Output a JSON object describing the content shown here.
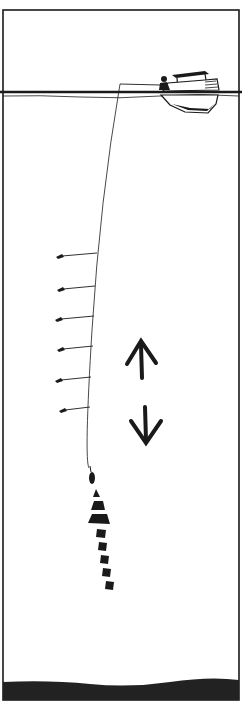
{
  "diagram": {
    "colors": {
      "ink": "#1a1a1a",
      "background": "#ffffff",
      "seabed": "#222222"
    },
    "frame": {
      "left": 3,
      "top": 10,
      "right": 239,
      "bottom": 700
    },
    "water_surface_y": 93,
    "boat": {
      "label": "boat-with-angler",
      "x": 160,
      "y": 68,
      "width": 60,
      "height": 48
    },
    "line": {
      "rod_tip": [
        120,
        84
      ],
      "bottom": [
        89,
        468
      ]
    },
    "hooks": [
      {
        "y": 255,
        "x_end": 57
      },
      {
        "y": 289,
        "x_end": 58
      },
      {
        "y": 318,
        "x_end": 56
      },
      {
        "y": 348,
        "x_end": 58
      },
      {
        "y": 380,
        "x_end": 56
      },
      {
        "y": 410,
        "x_end": 60
      }
    ],
    "sinker": {
      "x": 92,
      "y": 478
    },
    "arrows": [
      {
        "direction": "up",
        "x": 140,
        "y_top": 340,
        "y_bottom": 378
      },
      {
        "direction": "down",
        "x": 145,
        "y_top": 405,
        "y_bottom": 445
      }
    ],
    "motion_trail": {
      "segments": 8,
      "from": [
        95,
        482
      ],
      "to": [
        112,
        568
      ]
    },
    "seabed_y": 682
  }
}
